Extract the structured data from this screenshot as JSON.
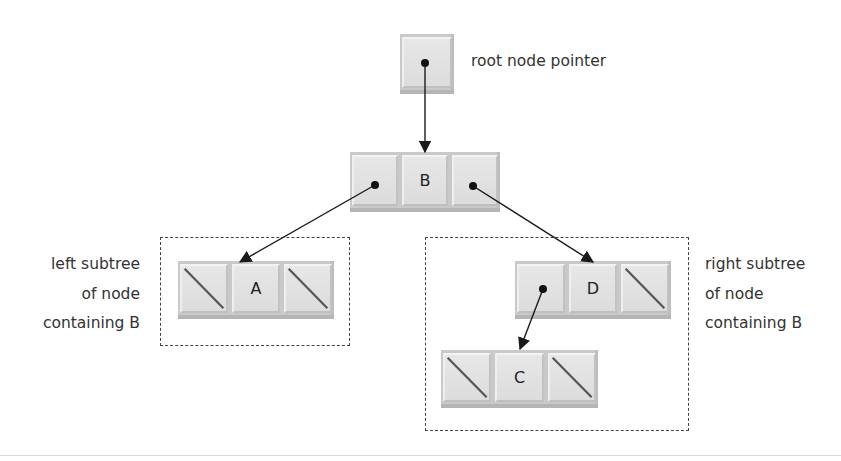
{
  "diagram": {
    "root_pointer": {
      "label": "root node pointer"
    },
    "nodes": [
      {
        "id": "B",
        "value": "B",
        "left": "A",
        "right": "D"
      },
      {
        "id": "A",
        "value": "A",
        "left": null,
        "right": null
      },
      {
        "id": "D",
        "value": "D",
        "left": "C",
        "right": null
      },
      {
        "id": "C",
        "value": "C",
        "left": null,
        "right": null
      }
    ],
    "left_subtree_label": [
      "left subtree",
      "of node",
      "containing B"
    ],
    "right_subtree_label": [
      "right subtree",
      "of node",
      "containing B"
    ],
    "colors": {
      "node_fill": "#dcdcdc",
      "arrow": "#222222",
      "dashed_border": "#444444",
      "background": "#ffffff"
    }
  }
}
